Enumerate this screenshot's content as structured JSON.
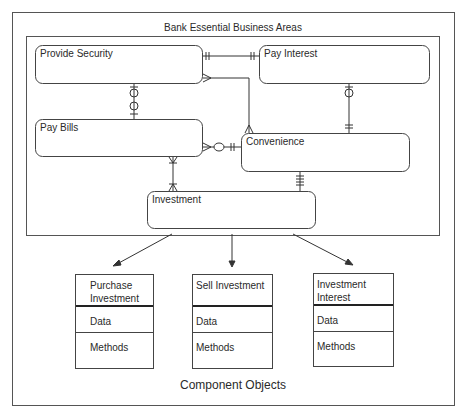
{
  "diagram": {
    "outer_title": "Bank Essential Business Areas",
    "caption": "Component Objects",
    "entities": [
      {
        "id": "provide-security",
        "label": "Provide Security"
      },
      {
        "id": "pay-interest",
        "label": "Pay Interest"
      },
      {
        "id": "pay-bills",
        "label": "Pay Bills"
      },
      {
        "id": "convenience",
        "label": "Convenience"
      },
      {
        "id": "investment",
        "label": "Investment"
      }
    ],
    "relationships": [
      {
        "from": "Provide Security",
        "to": "Pay Interest",
        "from_end": "one-and-only-one",
        "to_end": "one-and-only-one"
      },
      {
        "from": "Provide Security",
        "to": "Pay Bills",
        "from_end": "zero-or-one",
        "to_end": "zero-or-one"
      },
      {
        "from": "Provide Security",
        "to": "Convenience",
        "from_end": "many",
        "to_end": "many"
      },
      {
        "from": "Pay Interest",
        "to": "Convenience",
        "from_end": "zero-or-one",
        "to_end": "one-and-only-one"
      },
      {
        "from": "Pay Bills",
        "to": "Convenience",
        "from_end": "many",
        "to_end": "zero-or-one / one"
      },
      {
        "from": "Pay Bills",
        "to": "Investment",
        "from_end": "one-or-many",
        "to_end": "one-or-many"
      },
      {
        "from": "Convenience",
        "to": "Investment",
        "from_end": "one-and-only-one",
        "to_end": "many-bars"
      }
    ],
    "components": [
      {
        "title_line1": "Purchase",
        "title_line2": "Investment",
        "data": "Data",
        "methods": "Methods"
      },
      {
        "title_line1": "Sell Investment",
        "title_line2": "",
        "data": "Data",
        "methods": "Methods"
      },
      {
        "title_line1": "Investment",
        "title_line2": "Interest",
        "data": "Data",
        "methods": "Methods"
      }
    ]
  }
}
